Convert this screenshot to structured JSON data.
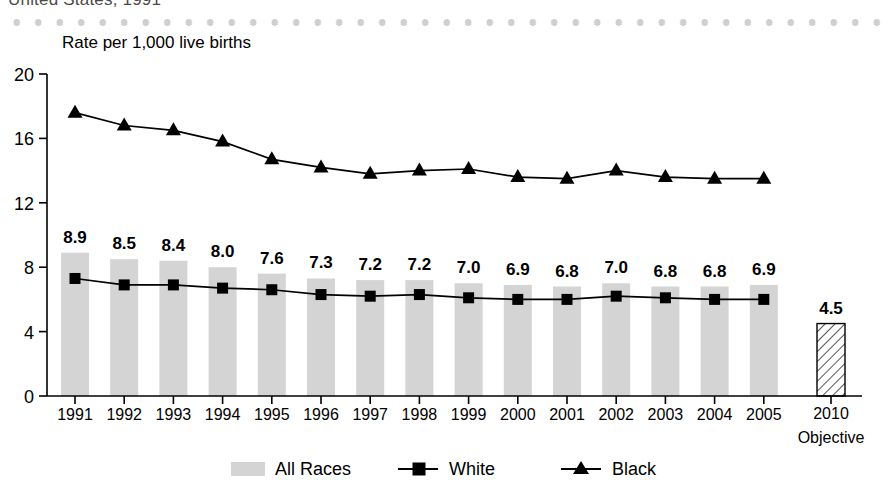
{
  "header": {
    "cut_off_title": "United States, 1991",
    "axis_unit_label": "Rate per 1,000 live births"
  },
  "chart_data": {
    "type": "bar",
    "title": "Rate per 1,000 live births",
    "xlabel": "",
    "ylabel": "Rate per 1,000 live births",
    "ylim": [
      0,
      20
    ],
    "yticks": [
      0,
      4,
      8,
      12,
      16,
      20
    ],
    "grid": false,
    "legend_position": "bottom",
    "categories": [
      "1991",
      "1992",
      "1993",
      "1994",
      "1995",
      "1996",
      "1997",
      "1998",
      "1999",
      "2000",
      "2001",
      "2002",
      "2003",
      "2004",
      "2005"
    ],
    "series": [
      {
        "name": "All Races",
        "marker": "bar",
        "values": [
          8.9,
          8.5,
          8.4,
          8.0,
          7.6,
          7.3,
          7.2,
          7.2,
          7.0,
          6.9,
          6.8,
          7.0,
          6.8,
          6.8,
          6.9
        ],
        "labels": [
          "8.9",
          "8.5",
          "8.4",
          "8.0",
          "7.6",
          "7.3",
          "7.2",
          "7.2",
          "7.0",
          "6.9",
          "6.8",
          "7.0",
          "6.8",
          "6.8",
          "6.9"
        ],
        "color": "#d4d4d4"
      },
      {
        "name": "White",
        "marker": "square",
        "values": [
          7.3,
          6.9,
          6.9,
          6.7,
          6.6,
          6.3,
          6.2,
          6.3,
          6.1,
          6.0,
          6.0,
          6.2,
          6.1,
          6.0,
          6.0
        ],
        "color": "#000000"
      },
      {
        "name": "Black",
        "marker": "triangle",
        "values": [
          17.6,
          16.8,
          16.5,
          15.8,
          14.7,
          14.2,
          13.8,
          14.0,
          14.1,
          13.6,
          13.5,
          14.0,
          13.6,
          13.5,
          13.5
        ],
        "color": "#000000"
      }
    ],
    "objective": {
      "label_top": "4.5",
      "value": 4.5,
      "tick_label": "2010",
      "sub_label": "Objective",
      "fill": "hatched"
    },
    "legend": [
      {
        "label": "All Races",
        "marker": "swatch"
      },
      {
        "label": "White",
        "marker": "square-line"
      },
      {
        "label": "Black",
        "marker": "triangle-line"
      }
    ]
  }
}
